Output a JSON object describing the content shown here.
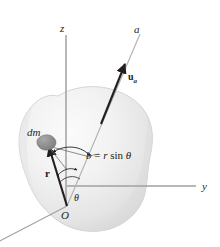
{
  "figure": {
    "background_color": "#ffffff",
    "width": 220,
    "height": 247
  },
  "colors": {
    "axis_line": "#9a9a9a",
    "construction_line": "#8c8c8c",
    "vector_line": "#231f20",
    "body_fill_light": "#f7f7f7",
    "body_fill_mid": "#e9e9e9",
    "body_fill_dark": "#d6d6d6",
    "body_outline": "#c8c8c8",
    "mass_element_fill": "#8e8e8e",
    "text": "#231f20"
  },
  "axes": [
    {
      "id": "z-axis",
      "label": "z",
      "label_x": 60,
      "label_y": 23,
      "description": "vertical axis pointing up"
    },
    {
      "id": "y-axis",
      "label": "y",
      "label_x": 202,
      "label_y": 181,
      "description": "horizontal axis pointing right"
    },
    {
      "id": "x-axis",
      "label": "",
      "label_x": 0,
      "label_y": 0,
      "description": "axis receding to lower left, label off-frame"
    },
    {
      "id": "a-axis",
      "label": "a",
      "label_x": 134,
      "label_y": 24,
      "description": "inclined arbitrary axis through O"
    }
  ],
  "labels": {
    "unit_vector": {
      "id": "u-a",
      "base": "u",
      "subscript": "a",
      "x": 128,
      "y": 72
    },
    "mass_element": {
      "id": "dm",
      "text": "dm",
      "x": 27,
      "y": 127
    },
    "position_vector": {
      "id": "r",
      "text": "r",
      "x": 45,
      "y": 168
    },
    "perpendicular_distance": {
      "id": "b-equation",
      "text": "b = r sin θ",
      "x": 86,
      "y": 150
    },
    "angle": {
      "id": "theta",
      "text": "θ",
      "x": 74,
      "y": 193
    },
    "origin": {
      "id": "O",
      "text": "O",
      "x": 61,
      "y": 210
    }
  },
  "equation_parts": {
    "lhs": "b",
    "operator": "=",
    "radius": "r",
    "function": "sin",
    "angle_symbol": "θ"
  },
  "geometry": {
    "origin_point": {
      "x": 67,
      "y": 206
    },
    "mass_point": {
      "x": 46,
      "y": 143
    },
    "b_foot_point": {
      "x": 91,
      "y": 156
    },
    "a_axis_tip": {
      "x": 141,
      "y": 33
    },
    "arrow_tip_u": {
      "x": 126,
      "y": 61
    }
  }
}
